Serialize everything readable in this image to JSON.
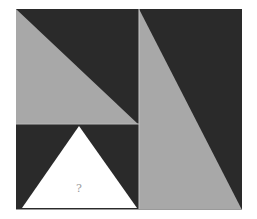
{
  "figure": {
    "type": "visual-puzzle",
    "colors": {
      "background": "#ffffff",
      "dark": "#2a2a2a",
      "gray": "#a8a8a8",
      "white": "#ffffff",
      "divider": "#c8c8c8",
      "question_mark": "#9a9a9a"
    },
    "panels": {
      "top_left": {
        "shape": "right-triangle",
        "fill": "gray",
        "on": "dark"
      },
      "bottom_left": {
        "shape": "isosceles-triangle",
        "fill": "white",
        "on": "dark",
        "label": "?"
      },
      "right": {
        "shape": "right-triangle",
        "fill": "gray",
        "on": "dark"
      }
    }
  }
}
